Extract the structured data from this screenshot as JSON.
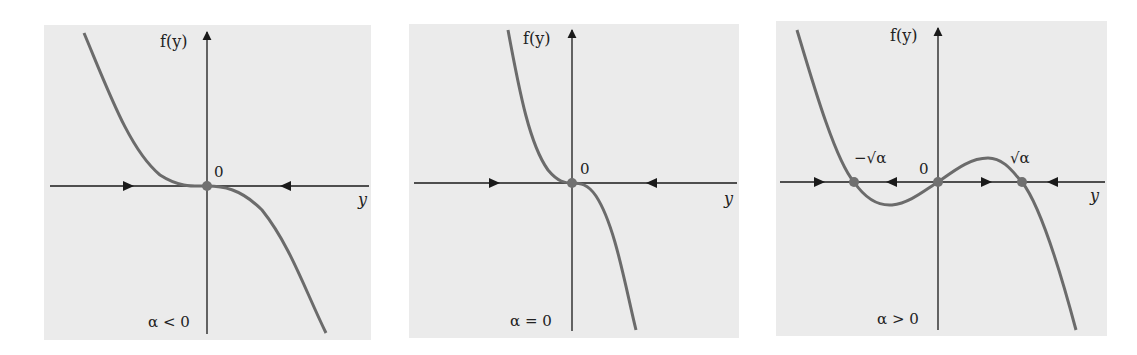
{
  "figure": {
    "colors": {
      "panel_bg": "#ebebeb",
      "curve": "#6b6b6b",
      "axis": "#1a1a1a",
      "equilibrium_dot": "#707070"
    },
    "panels": [
      {
        "id": "alpha-negative",
        "y_axis_label": "f(y)",
        "x_axis_label": "y",
        "origin_label": "0",
        "condition_label": "α < 0",
        "equilibria": [
          {
            "label": "0",
            "x": 0
          }
        ],
        "flow_arrows": [
          "right",
          "left"
        ]
      },
      {
        "id": "alpha-zero",
        "y_axis_label": "f(y)",
        "x_axis_label": "y",
        "origin_label": "0",
        "condition_label": "α = 0",
        "equilibria": [
          {
            "label": "0",
            "x": 0
          }
        ],
        "flow_arrows": [
          "right",
          "left"
        ]
      },
      {
        "id": "alpha-positive",
        "y_axis_label": "f(y)",
        "x_axis_label": "y",
        "origin_label": "0",
        "condition_label": "α > 0",
        "root_labels": {
          "negative": "−√α",
          "positive": "√α"
        },
        "equilibria": [
          {
            "label": "−√α",
            "x": -1
          },
          {
            "label": "0",
            "x": 0
          },
          {
            "label": "√α",
            "x": 1
          }
        ],
        "flow_arrows": [
          "right",
          "left",
          "right",
          "left"
        ]
      }
    ]
  }
}
